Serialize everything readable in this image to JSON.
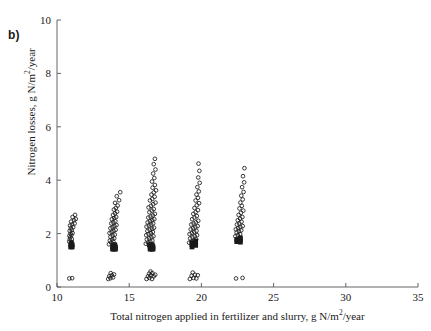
{
  "figure": {
    "panel_label": "b)",
    "background": "#ffffff",
    "axis_color": "#555555",
    "marker_color": "#1a1a1a"
  },
  "axes": {
    "x": {
      "title_prefix": "Total nitrogen applied in fertilizer and slurry, g N/m",
      "title_sup": "2",
      "title_suffix": "/year",
      "ticks": [
        10,
        15,
        20,
        25,
        30,
        35
      ],
      "min": 10,
      "max": 35
    },
    "y": {
      "title_prefix": "Nitrogen losses, g N/m",
      "title_sup": "2",
      "title_suffix": "/year",
      "ticks": [
        0,
        2,
        4,
        6,
        8,
        10
      ],
      "min": 0,
      "max": 10
    }
  },
  "chart_data": {
    "type": "scatter",
    "title": "",
    "xlabel": "Total nitrogen applied in fertilizer and slurry, g N/m2/year",
    "ylabel": "Nitrogen losses, g N/m2/year",
    "xlim": [
      10,
      35
    ],
    "ylim": [
      0,
      10
    ],
    "xticks": [
      10,
      15,
      20,
      25,
      30,
      35
    ],
    "yticks": [
      0,
      2,
      4,
      6,
      8,
      10
    ],
    "grid": false,
    "legend": null,
    "series": [
      {
        "name": "nitrogen-losses",
        "marker": "open-circle",
        "points": [
          [
            10.85,
            0.32
          ],
          [
            11.05,
            0.33
          ],
          [
            10.85,
            1.7
          ],
          [
            10.88,
            1.78
          ],
          [
            11.02,
            1.8
          ],
          [
            10.92,
            1.86
          ],
          [
            10.86,
            1.92
          ],
          [
            11.0,
            1.95
          ],
          [
            10.94,
            2.0
          ],
          [
            11.08,
            2.02
          ],
          [
            10.88,
            2.1
          ],
          [
            11.02,
            2.14
          ],
          [
            10.96,
            2.2
          ],
          [
            11.12,
            2.24
          ],
          [
            10.9,
            2.3
          ],
          [
            11.05,
            2.34
          ],
          [
            11.22,
            2.38
          ],
          [
            10.98,
            2.45
          ],
          [
            11.18,
            2.5
          ],
          [
            11.3,
            2.55
          ],
          [
            11.08,
            2.62
          ],
          [
            11.25,
            2.7
          ],
          [
            13.55,
            0.3
          ],
          [
            13.7,
            0.33
          ],
          [
            13.88,
            0.36
          ],
          [
            13.62,
            0.4
          ],
          [
            13.8,
            0.44
          ],
          [
            13.95,
            0.47
          ],
          [
            13.72,
            0.52
          ],
          [
            13.6,
            1.6
          ],
          [
            13.75,
            1.66
          ],
          [
            13.9,
            1.7
          ],
          [
            13.66,
            1.74
          ],
          [
            13.82,
            1.78
          ],
          [
            13.96,
            1.82
          ],
          [
            13.7,
            1.88
          ],
          [
            13.86,
            1.92
          ],
          [
            14.0,
            1.96
          ],
          [
            13.64,
            2.02
          ],
          [
            13.78,
            2.06
          ],
          [
            13.92,
            2.1
          ],
          [
            14.06,
            2.14
          ],
          [
            13.7,
            2.2
          ],
          [
            13.84,
            2.24
          ],
          [
            13.98,
            2.28
          ],
          [
            14.12,
            2.32
          ],
          [
            13.76,
            2.38
          ],
          [
            13.9,
            2.42
          ],
          [
            14.04,
            2.46
          ],
          [
            13.8,
            2.54
          ],
          [
            13.96,
            2.58
          ],
          [
            14.1,
            2.62
          ],
          [
            13.88,
            2.7
          ],
          [
            14.02,
            2.76
          ],
          [
            14.16,
            2.82
          ],
          [
            13.94,
            2.9
          ],
          [
            14.08,
            2.96
          ],
          [
            14.2,
            3.05
          ],
          [
            14.02,
            3.15
          ],
          [
            14.3,
            3.25
          ],
          [
            14.14,
            3.4
          ],
          [
            14.38,
            3.55
          ],
          [
            16.2,
            0.3
          ],
          [
            16.4,
            0.34
          ],
          [
            16.58,
            0.3
          ],
          [
            16.3,
            0.4
          ],
          [
            16.5,
            0.44
          ],
          [
            16.7,
            0.4
          ],
          [
            16.38,
            0.5
          ],
          [
            16.6,
            0.52
          ],
          [
            16.8,
            0.46
          ],
          [
            16.48,
            0.58
          ],
          [
            16.15,
            1.62
          ],
          [
            16.3,
            1.66
          ],
          [
            16.46,
            1.7
          ],
          [
            16.6,
            1.74
          ],
          [
            16.22,
            1.78
          ],
          [
            16.38,
            1.82
          ],
          [
            16.54,
            1.86
          ],
          [
            16.68,
            1.9
          ],
          [
            16.18,
            1.94
          ],
          [
            16.34,
            1.98
          ],
          [
            16.5,
            2.02
          ],
          [
            16.64,
            2.06
          ],
          [
            16.26,
            2.1
          ],
          [
            16.42,
            2.14
          ],
          [
            16.58,
            2.18
          ],
          [
            16.72,
            2.22
          ],
          [
            16.2,
            2.26
          ],
          [
            16.36,
            2.3
          ],
          [
            16.52,
            2.34
          ],
          [
            16.66,
            2.38
          ],
          [
            16.28,
            2.42
          ],
          [
            16.44,
            2.46
          ],
          [
            16.6,
            2.5
          ],
          [
            16.74,
            2.54
          ],
          [
            16.32,
            2.6
          ],
          [
            16.48,
            2.64
          ],
          [
            16.64,
            2.68
          ],
          [
            16.78,
            2.74
          ],
          [
            16.4,
            2.8
          ],
          [
            16.56,
            2.86
          ],
          [
            16.7,
            2.92
          ],
          [
            16.34,
            2.98
          ],
          [
            16.5,
            3.04
          ],
          [
            16.66,
            3.1
          ],
          [
            16.82,
            3.16
          ],
          [
            16.44,
            3.24
          ],
          [
            16.6,
            3.3
          ],
          [
            16.76,
            3.38
          ],
          [
            16.54,
            3.46
          ],
          [
            16.7,
            3.54
          ],
          [
            16.86,
            3.62
          ],
          [
            16.62,
            3.72
          ],
          [
            16.78,
            3.82
          ],
          [
            16.58,
            3.95
          ],
          [
            16.74,
            4.08
          ],
          [
            16.66,
            4.25
          ],
          [
            16.82,
            4.4
          ],
          [
            16.7,
            4.6
          ],
          [
            16.78,
            4.8
          ],
          [
            19.2,
            0.3
          ],
          [
            19.45,
            0.34
          ],
          [
            19.65,
            0.32
          ],
          [
            19.32,
            0.42
          ],
          [
            19.55,
            0.46
          ],
          [
            19.75,
            0.44
          ],
          [
            19.4,
            0.54
          ],
          [
            19.15,
            1.66
          ],
          [
            19.32,
            1.7
          ],
          [
            19.48,
            1.74
          ],
          [
            19.64,
            1.78
          ],
          [
            19.22,
            1.82
          ],
          [
            19.38,
            1.86
          ],
          [
            19.54,
            1.9
          ],
          [
            19.7,
            1.94
          ],
          [
            19.18,
            1.98
          ],
          [
            19.34,
            2.02
          ],
          [
            19.5,
            2.06
          ],
          [
            19.66,
            2.1
          ],
          [
            19.26,
            2.16
          ],
          [
            19.42,
            2.2
          ],
          [
            19.58,
            2.24
          ],
          [
            19.74,
            2.28
          ],
          [
            19.3,
            2.34
          ],
          [
            19.46,
            2.38
          ],
          [
            19.62,
            2.42
          ],
          [
            19.78,
            2.48
          ],
          [
            19.36,
            2.54
          ],
          [
            19.52,
            2.6
          ],
          [
            19.68,
            2.66
          ],
          [
            19.44,
            2.74
          ],
          [
            19.6,
            2.8
          ],
          [
            19.76,
            2.88
          ],
          [
            19.52,
            2.96
          ],
          [
            19.68,
            3.06
          ],
          [
            19.84,
            3.14
          ],
          [
            19.6,
            3.24
          ],
          [
            19.76,
            3.34
          ],
          [
            19.66,
            3.46
          ],
          [
            19.82,
            3.58
          ],
          [
            19.72,
            3.74
          ],
          [
            19.88,
            3.9
          ],
          [
            19.78,
            4.1
          ],
          [
            19.86,
            4.35
          ],
          [
            19.8,
            4.62
          ],
          [
            22.4,
            0.32
          ],
          [
            22.85,
            0.34
          ],
          [
            22.35,
            1.9
          ],
          [
            22.52,
            1.94
          ],
          [
            22.68,
            1.98
          ],
          [
            22.44,
            2.04
          ],
          [
            22.6,
            2.08
          ],
          [
            22.76,
            2.12
          ],
          [
            22.38,
            2.16
          ],
          [
            22.54,
            2.2
          ],
          [
            22.7,
            2.24
          ],
          [
            22.86,
            2.28
          ],
          [
            22.46,
            2.34
          ],
          [
            22.62,
            2.38
          ],
          [
            22.78,
            2.44
          ],
          [
            22.52,
            2.5
          ],
          [
            22.68,
            2.56
          ],
          [
            22.84,
            2.62
          ],
          [
            22.58,
            2.7
          ],
          [
            22.74,
            2.78
          ],
          [
            22.9,
            2.86
          ],
          [
            22.64,
            2.94
          ],
          [
            22.8,
            3.04
          ],
          [
            22.7,
            3.16
          ],
          [
            22.86,
            3.28
          ],
          [
            22.76,
            3.42
          ],
          [
            22.92,
            3.56
          ],
          [
            22.82,
            3.74
          ],
          [
            22.96,
            3.92
          ],
          [
            22.88,
            4.15
          ],
          [
            22.98,
            4.45
          ]
        ]
      },
      {
        "name": "nitrogen-losses-dense-block",
        "marker": "filled-square",
        "points": [
          [
            10.95,
            1.58
          ],
          [
            11.05,
            1.58
          ],
          [
            10.95,
            1.5
          ],
          [
            11.05,
            1.5
          ],
          [
            11.0,
            1.66
          ],
          [
            13.85,
            1.5
          ],
          [
            13.95,
            1.5
          ],
          [
            14.05,
            1.5
          ],
          [
            13.85,
            1.42
          ],
          [
            13.95,
            1.42
          ],
          [
            14.05,
            1.42
          ],
          [
            13.9,
            1.58
          ],
          [
            14.0,
            1.58
          ],
          [
            16.45,
            1.5
          ],
          [
            16.55,
            1.5
          ],
          [
            16.65,
            1.5
          ],
          [
            16.45,
            1.42
          ],
          [
            16.55,
            1.42
          ],
          [
            16.65,
            1.42
          ],
          [
            16.5,
            1.58
          ],
          [
            16.6,
            1.58
          ],
          [
            16.4,
            1.58
          ],
          [
            19.35,
            1.66
          ],
          [
            19.35,
            1.58
          ],
          [
            19.6,
            1.72
          ],
          [
            19.6,
            1.64
          ],
          [
            19.6,
            1.56
          ],
          [
            19.35,
            1.5
          ],
          [
            22.45,
            1.78
          ],
          [
            22.45,
            1.7
          ],
          [
            22.7,
            1.84
          ],
          [
            22.7,
            1.76
          ],
          [
            22.7,
            1.68
          ]
        ]
      }
    ]
  }
}
